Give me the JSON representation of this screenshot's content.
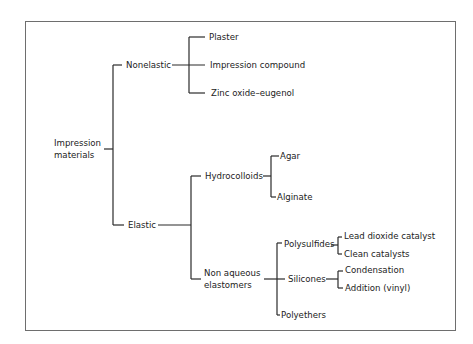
{
  "diagram": {
    "type": "tree",
    "root": "Impression materials",
    "nodes": {
      "root": {
        "label_line1": "Impression",
        "label_line2": "materials"
      },
      "nonelastic": {
        "label": "Nonelastic"
      },
      "plaster": {
        "label": "Plaster"
      },
      "impression_compound": {
        "label": "Impression compound"
      },
      "zinc_oxide": {
        "label": "Zinc oxide–eugenol"
      },
      "elastic": {
        "label": "Elastic"
      },
      "hydrocolloids": {
        "label": "Hydrocolloids"
      },
      "agar": {
        "label": "Agar"
      },
      "alginate": {
        "label": "Alginate"
      },
      "non_aqueous": {
        "label_line1": "Non aqueous",
        "label_line2": "elastomers"
      },
      "polysulfides": {
        "label": "Polysulfides"
      },
      "lead_dioxide": {
        "label": "Lead dioxide catalyst"
      },
      "clean_catalysts": {
        "label": "Clean catalysts"
      },
      "silicones": {
        "label": "Silicones"
      },
      "condensation": {
        "label": "Condensation"
      },
      "addition": {
        "label": "Addition (vinyl)"
      },
      "polyethers": {
        "label": "Polyethers"
      }
    },
    "edges": [
      [
        "Impression materials",
        "Nonelastic"
      ],
      [
        "Impression materials",
        "Elastic"
      ],
      [
        "Nonelastic",
        "Plaster"
      ],
      [
        "Nonelastic",
        "Impression compound"
      ],
      [
        "Nonelastic",
        "Zinc oxide–eugenol"
      ],
      [
        "Elastic",
        "Hydrocolloids"
      ],
      [
        "Elastic",
        "Non aqueous elastomers"
      ],
      [
        "Hydrocolloids",
        "Agar"
      ],
      [
        "Hydrocolloids",
        "Alginate"
      ],
      [
        "Non aqueous elastomers",
        "Polysulfides"
      ],
      [
        "Non aqueous elastomers",
        "Silicones"
      ],
      [
        "Non aqueous elastomers",
        "Polyethers"
      ],
      [
        "Polysulfides",
        "Lead dioxide catalyst"
      ],
      [
        "Polysulfides",
        "Clean catalysts"
      ],
      [
        "Silicones",
        "Condensation"
      ],
      [
        "Silicones",
        "Addition (vinyl)"
      ]
    ],
    "colors": {
      "line": "#2a2a2a",
      "frame": "#6e6e6e",
      "text": "#222222"
    }
  }
}
